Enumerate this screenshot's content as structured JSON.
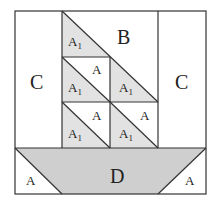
{
  "diagram": {
    "title": "",
    "type": "quilt-block sailboat piece diagram",
    "colors": {
      "background": "#ffffff",
      "line": "#333333",
      "sail_fill": "#e2e2e2",
      "hull_fill": "#cfcfcf"
    },
    "labels": {
      "B": "B",
      "C_left": "C",
      "C_right": "C",
      "D": "D",
      "A": "A",
      "A1_main": "A",
      "A1_sub": "1"
    },
    "pieces": [
      {
        "id": "B",
        "label": "B",
        "shape": "trapezoid",
        "region": "top of sail area, right of long diagonal"
      },
      {
        "id": "C-left",
        "label": "C",
        "shape": "rectangle",
        "region": "left column"
      },
      {
        "id": "C-right",
        "label": "C",
        "shape": "rectangle",
        "region": "right column"
      },
      {
        "id": "D",
        "label": "D",
        "shape": "trapezoid",
        "region": "hull",
        "shaded": true
      },
      {
        "id": "A-hull-left",
        "label": "A",
        "shape": "triangle",
        "region": "bottom-left corner"
      },
      {
        "id": "A-hull-right",
        "label": "A",
        "shape": "triangle",
        "region": "bottom-right corner"
      },
      {
        "id": "A1-top",
        "label": "A1",
        "shape": "triangle",
        "shaded": true
      },
      {
        "id": "A-r1c1",
        "label": "A",
        "shape": "triangle"
      },
      {
        "id": "A1-r1c1",
        "label": "A1",
        "shape": "triangle",
        "shaded": true
      },
      {
        "id": "A1-r1c2",
        "label": "A1",
        "shape": "triangle",
        "shaded": true
      },
      {
        "id": "A-r2c1",
        "label": "A",
        "shape": "triangle"
      },
      {
        "id": "A1-r2c1",
        "label": "A1",
        "shape": "triangle",
        "shaded": true
      },
      {
        "id": "A-r2c2",
        "label": "A",
        "shape": "triangle"
      },
      {
        "id": "A1-r2c2",
        "label": "A1",
        "shape": "triangle",
        "shaded": true
      }
    ]
  }
}
